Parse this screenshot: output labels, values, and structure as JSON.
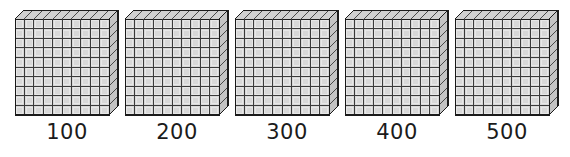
{
  "figure": {
    "type": "base-ten-blocks",
    "background_color": "#ffffff",
    "grid_rows": 10,
    "grid_columns": 10,
    "units_per_flat": 100,
    "colors": {
      "cube_face": "#d8d8d8",
      "cube_face_top": "#d0d0d0",
      "cube_face_side": "#c4c4c4",
      "outline": "#1a1a1a",
      "gridline": "#3a3a3a",
      "label_text": "#1b1b1b"
    },
    "blocks": [
      {
        "label": "100",
        "value": 100,
        "flats": 1
      },
      {
        "label": "200",
        "value": 200,
        "flats": 2
      },
      {
        "label": "300",
        "value": 300,
        "flats": 3
      },
      {
        "label": "400",
        "value": 400,
        "flats": 4
      },
      {
        "label": "500",
        "value": 500,
        "flats": 5
      }
    ]
  }
}
